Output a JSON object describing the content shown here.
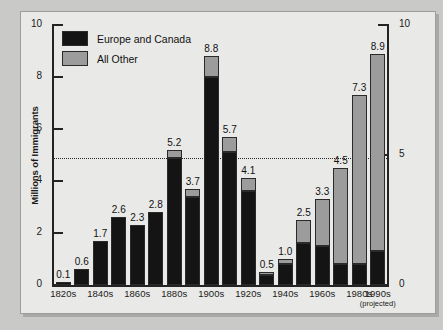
{
  "chart_data": {
    "type": "bar",
    "title": "",
    "subtitle": "",
    "xlabel": "",
    "ylabel": "Millions of Immigrants",
    "ylim": [
      0,
      10
    ],
    "yticks": [
      0,
      2,
      4,
      6,
      8,
      10
    ],
    "ytick_labels": [
      "0",
      "2",
      "4",
      "6",
      "8",
      "10"
    ],
    "y2ticks": [
      0,
      5,
      10
    ],
    "y2tick_labels": [
      "0",
      "5",
      "10"
    ],
    "grid": false,
    "reference_line": 4.9,
    "stacked": true,
    "legend_position": "top-left",
    "legend": [
      "Europe and Canada",
      "All Other"
    ],
    "colors": {
      "europe_and_canada": "#141414",
      "all_other": "#9c9c9c",
      "panel_background": "#e9e9e7",
      "page_background": "#c9c9c7",
      "axis": "#232323",
      "text": "#1a1a1a"
    },
    "categories": [
      "1820s",
      "1830s",
      "1840s",
      "1850s",
      "1860s",
      "1870s",
      "1880s",
      "1890s",
      "1900s",
      "1910s",
      "1920s",
      "1930s",
      "1940s",
      "1950s",
      "1960s",
      "1970s",
      "1980s",
      "1990s"
    ],
    "tick_labels": [
      "1820s",
      "",
      "1840s",
      "",
      "1860s",
      "",
      "1880s",
      "",
      "1900s",
      "",
      "1920s",
      "",
      "1940s",
      "",
      "1960s",
      "",
      "1980s",
      "1990s"
    ],
    "projected_note": "(projected)",
    "projected_category": "1990s",
    "totals": [
      0.1,
      0.6,
      1.7,
      2.6,
      2.3,
      2.8,
      5.2,
      3.7,
      8.8,
      5.7,
      4.1,
      0.5,
      1.0,
      2.5,
      3.3,
      4.5,
      7.3,
      8.9
    ],
    "data_labels": [
      "0.1",
      "0.6",
      "1.7",
      "2.6",
      "2.3",
      "2.8",
      "5.2",
      "3.7",
      "8.8",
      "5.7",
      "4.1",
      "0.5",
      "1.0",
      "2.5",
      "3.3",
      "4.5",
      "7.3",
      "8.9"
    ],
    "series": [
      {
        "name": "Europe and Canada",
        "color": "#141414",
        "values": [
          0.1,
          0.6,
          1.7,
          2.6,
          2.3,
          2.8,
          4.9,
          3.4,
          8.0,
          5.1,
          3.6,
          0.4,
          0.8,
          1.6,
          1.5,
          0.8,
          0.8,
          1.3
        ]
      },
      {
        "name": "All Other",
        "color": "#9c9c9c",
        "values": [
          0.0,
          0.0,
          0.0,
          0.0,
          0.0,
          0.0,
          0.3,
          0.3,
          0.8,
          0.6,
          0.5,
          0.1,
          0.2,
          0.9,
          1.8,
          3.7,
          6.5,
          7.6
        ]
      }
    ]
  }
}
